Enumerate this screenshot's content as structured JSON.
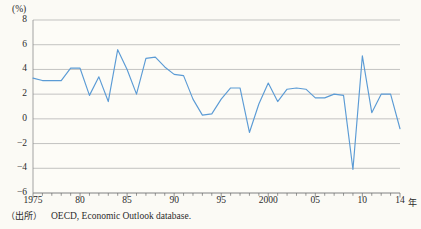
{
  "figure": {
    "unit_label": "(%)",
    "year_axis_unit": "年",
    "source_prefix": "（出所）",
    "source_text": "OECD, Economic Outlook database."
  },
  "chart_data": {
    "type": "line",
    "title": "",
    "subtitle": "",
    "xlabel": "年",
    "ylabel": "(%)",
    "ylim": [
      -6,
      8
    ],
    "xlim": [
      1975,
      2014
    ],
    "y_ticks": [
      8,
      6,
      4,
      2,
      0,
      -2,
      -4,
      -6
    ],
    "y_tick_labels": [
      "8",
      "6",
      "4",
      "2",
      "0",
      "-2",
      "-4",
      "-6"
    ],
    "x_ticks": [
      1975,
      1980,
      1985,
      1990,
      1995,
      2000,
      2005,
      2010,
      2014
    ],
    "x_tick_labels": [
      "1975",
      "80",
      "85",
      "90",
      "95",
      "2000",
      "05",
      "10",
      "14"
    ],
    "x_minor_tick_interval": 1,
    "grid": "horizontal",
    "legend": "none",
    "line_color": "#5b9bd5",
    "series": [
      {
        "name": "成長率",
        "x": [
          1975,
          1976,
          1977,
          1978,
          1979,
          1980,
          1981,
          1982,
          1983,
          1984,
          1985,
          1986,
          1987,
          1988,
          1989,
          1990,
          1991,
          1992,
          1993,
          1994,
          1995,
          1996,
          1997,
          1998,
          1999,
          2000,
          2001,
          2002,
          2003,
          2004,
          2005,
          2006,
          2007,
          2008,
          2009,
          2010,
          2011,
          2012,
          2013,
          2014
        ],
        "values": [
          3.3,
          3.1,
          3.1,
          3.1,
          4.1,
          4.1,
          1.9,
          3.4,
          1.4,
          5.6,
          4.0,
          2.0,
          4.9,
          5.0,
          4.2,
          3.6,
          3.5,
          1.6,
          0.3,
          0.4,
          1.6,
          2.5,
          2.5,
          -1.1,
          1.2,
          2.9,
          1.4,
          2.4,
          2.5,
          2.4,
          1.7,
          1.7,
          2.0,
          1.9,
          -4.1,
          5.1,
          0.5,
          2.0,
          2.0,
          -0.8
        ]
      }
    ]
  }
}
